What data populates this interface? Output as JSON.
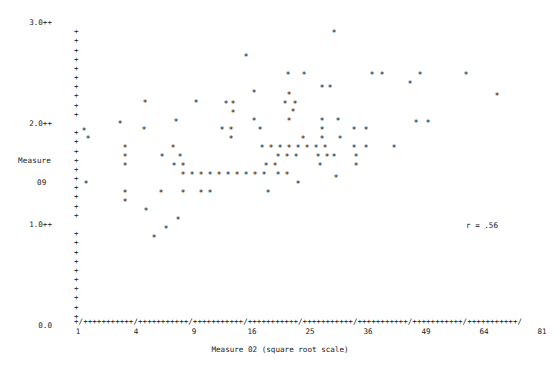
{
  "chart_data": {
    "type": "scatter",
    "title": "",
    "xlabel": "Measure 02 (square root scale)",
    "ylabel_line1": "Measure",
    "ylabel_line2": "09",
    "annotation": "r = .56",
    "correlation": 0.56,
    "x_scale": "square root",
    "x_tick_labels": [
      "1",
      "4",
      "9",
      "16",
      "25",
      "36",
      "49",
      "64",
      "81"
    ],
    "x_tick_values": [
      1,
      4,
      9,
      16,
      25,
      36,
      49,
      64,
      81
    ],
    "xlim": [
      1,
      81
    ],
    "y_tick_labels": [
      "3.0++",
      "2.0++",
      "1.0++",
      "0.0"
    ],
    "y_tick_values": [
      3.0,
      2.0,
      1.0,
      0.0
    ],
    "ylim": [
      0.0,
      3.0
    ],
    "grid": false,
    "legend": false,
    "axis_style": "character-plot",
    "axis_char_y": "+",
    "axis_char_x": "+",
    "axis_char_x_major": "/",
    "marker": "*",
    "x_axis_line": "+/+++++++++++/+++++++++++/+++++++++++/+++++++++++/+++++++++++/+++++++++++/+++++++++++/+++++++++++/",
    "y_axis_rows": [
      {
        "label": "3.0++",
        "tick": "",
        "value": 3.0
      },
      {
        "label": "",
        "tick": "+",
        "value": 2.91
      },
      {
        "label": "",
        "tick": "+",
        "value": 2.82
      },
      {
        "label": "",
        "tick": "+",
        "value": 2.73
      },
      {
        "label": "",
        "tick": "+",
        "value": 2.64
      },
      {
        "label": "",
        "tick": "+",
        "value": 2.55
      },
      {
        "label": "",
        "tick": "+",
        "value": 2.45
      },
      {
        "label": "",
        "tick": "+",
        "value": 2.36
      },
      {
        "label": "",
        "tick": "+",
        "value": 2.27
      },
      {
        "label": "",
        "tick": "+",
        "value": 2.18
      },
      {
        "label": "",
        "tick": "+",
        "value": 2.09
      },
      {
        "label": "2.0++",
        "tick": "",
        "value": 2.0
      },
      {
        "label": "",
        "tick": "+",
        "value": 1.91
      },
      {
        "label": "",
        "tick": "+",
        "value": 1.82
      },
      {
        "label": "",
        "tick": "+",
        "value": 1.73
      },
      {
        "label": "",
        "tick": "+",
        "value": 1.64
      },
      {
        "label": "",
        "tick": "+",
        "value": 1.55
      },
      {
        "label": "",
        "tick": "+",
        "value": 1.45
      },
      {
        "label": "",
        "tick": "+",
        "value": 1.36
      },
      {
        "label": "",
        "tick": "+",
        "value": 1.27
      },
      {
        "label": "",
        "tick": "+",
        "value": 1.18
      },
      {
        "label": "",
        "tick": "+",
        "value": 1.09
      },
      {
        "label": "1.0++",
        "tick": "",
        "value": 1.0
      },
      {
        "label": "",
        "tick": "+",
        "value": 0.91
      },
      {
        "label": "",
        "tick": "+",
        "value": 0.82
      },
      {
        "label": "",
        "tick": "+",
        "value": 0.73
      },
      {
        "label": "",
        "tick": "+",
        "value": 0.64
      },
      {
        "label": "",
        "tick": "+",
        "value": 0.55
      },
      {
        "label": "",
        "tick": "+",
        "value": 0.45
      },
      {
        "label": "",
        "tick": "+",
        "value": 0.36
      },
      {
        "label": "",
        "tick": "+",
        "value": 0.27
      },
      {
        "label": "",
        "tick": "+",
        "value": 0.18
      },
      {
        "label": "",
        "tick": "+",
        "value": 0.09
      },
      {
        "label": "0.0",
        "tick": "",
        "value": 0.0
      }
    ],
    "points": [
      {
        "px": 145,
        "py": 103,
        "x": 5.2,
        "y": 2.36
      },
      {
        "px": 246,
        "py": 57,
        "x": 21.0,
        "y": 2.82
      },
      {
        "px": 334,
        "py": 33,
        "x": 40.5,
        "y": 3.05
      },
      {
        "px": 288,
        "py": 75,
        "x": 30.0,
        "y": 2.64
      },
      {
        "px": 322,
        "py": 88,
        "x": 37.5,
        "y": 2.5
      },
      {
        "px": 304,
        "py": 75,
        "x": 33.5,
        "y": 2.64
      },
      {
        "px": 372,
        "py": 75,
        "x": 50.0,
        "y": 2.64
      },
      {
        "px": 382,
        "py": 75,
        "x": 53.0,
        "y": 2.64
      },
      {
        "px": 420,
        "py": 75,
        "x": 64.0,
        "y": 2.64
      },
      {
        "px": 466,
        "py": 75,
        "x": 78.0,
        "y": 2.64
      },
      {
        "px": 254,
        "py": 93,
        "x": 22.5,
        "y": 2.45
      },
      {
        "px": 289,
        "py": 95,
        "x": 30.2,
        "y": 2.43
      },
      {
        "px": 330,
        "py": 88,
        "x": 38.8,
        "y": 2.5
      },
      {
        "px": 410,
        "py": 84,
        "x": 61.0,
        "y": 2.54
      },
      {
        "px": 196,
        "py": 103,
        "x": 12.0,
        "y": 2.36
      },
      {
        "px": 226,
        "py": 104,
        "x": 17.5,
        "y": 2.35
      },
      {
        "px": 233,
        "py": 104,
        "x": 19.0,
        "y": 2.35
      },
      {
        "px": 285,
        "py": 104,
        "x": 29.2,
        "y": 2.35
      },
      {
        "px": 295,
        "py": 104,
        "x": 31.2,
        "y": 2.35
      },
      {
        "px": 497,
        "py": 96,
        "x": 86.0,
        "y": 2.42
      },
      {
        "px": 293,
        "py": 112,
        "x": 30.8,
        "y": 2.27
      },
      {
        "px": 233,
        "py": 113,
        "x": 19.0,
        "y": 2.26
      },
      {
        "px": 120,
        "py": 124,
        "x": 2.8,
        "y": 2.15
      },
      {
        "px": 176,
        "py": 122,
        "x": 9.0,
        "y": 2.17
      },
      {
        "px": 254,
        "py": 121,
        "x": 22.5,
        "y": 2.18
      },
      {
        "px": 289,
        "py": 121,
        "x": 30.2,
        "y": 2.18
      },
      {
        "px": 322,
        "py": 121,
        "x": 37.5,
        "y": 2.18
      },
      {
        "px": 338,
        "py": 121,
        "x": 41.0,
        "y": 2.18
      },
      {
        "px": 84,
        "py": 131,
        "x": 1.2,
        "y": 2.08
      },
      {
        "px": 144,
        "py": 130,
        "x": 5.1,
        "y": 2.09
      },
      {
        "px": 222,
        "py": 130,
        "x": 16.8,
        "y": 2.09
      },
      {
        "px": 231,
        "py": 130,
        "x": 18.6,
        "y": 2.09
      },
      {
        "px": 260,
        "py": 130,
        "x": 23.7,
        "y": 2.09
      },
      {
        "px": 322,
        "py": 130,
        "x": 37.5,
        "y": 2.09
      },
      {
        "px": 354,
        "py": 130,
        "x": 45.5,
        "y": 2.09
      },
      {
        "px": 416,
        "py": 123,
        "x": 63.0,
        "y": 2.16
      },
      {
        "px": 428,
        "py": 123,
        "x": 66.5,
        "y": 2.16
      },
      {
        "px": 231,
        "py": 139,
        "x": 18.6,
        "y": 2.0
      },
      {
        "px": 322,
        "py": 139,
        "x": 37.5,
        "y": 2.0
      },
      {
        "px": 366,
        "py": 130,
        "x": 48.5,
        "y": 2.09
      },
      {
        "px": 125,
        "py": 148,
        "x": 3.2,
        "y": 1.91
      },
      {
        "px": 173,
        "py": 148,
        "x": 8.7,
        "y": 1.91
      },
      {
        "px": 88,
        "py": 139,
        "x": 1.4,
        "y": 2.0
      },
      {
        "px": 262,
        "py": 148,
        "x": 24.0,
        "y": 1.91
      },
      {
        "px": 271,
        "py": 148,
        "x": 25.8,
        "y": 1.91
      },
      {
        "px": 280,
        "py": 148,
        "x": 27.6,
        "y": 1.91
      },
      {
        "px": 289,
        "py": 148,
        "x": 29.5,
        "y": 1.91
      },
      {
        "px": 298,
        "py": 148,
        "x": 31.5,
        "y": 1.91
      },
      {
        "px": 307,
        "py": 148,
        "x": 33.5,
        "y": 1.91
      },
      {
        "px": 316,
        "py": 148,
        "x": 35.5,
        "y": 1.91
      },
      {
        "px": 325,
        "py": 148,
        "x": 37.6,
        "y": 1.91
      },
      {
        "px": 354,
        "py": 148,
        "x": 45.5,
        "y": 1.91
      },
      {
        "px": 366,
        "py": 148,
        "x": 48.5,
        "y": 1.91
      },
      {
        "px": 394,
        "py": 148,
        "x": 56.5,
        "y": 1.91
      },
      {
        "px": 303,
        "py": 139,
        "x": 32.5,
        "y": 2.0
      },
      {
        "px": 340,
        "py": 139,
        "x": 41.5,
        "y": 2.0
      },
      {
        "px": 125,
        "py": 157,
        "x": 3.2,
        "y": 1.82
      },
      {
        "px": 162,
        "py": 157,
        "x": 7.5,
        "y": 1.82
      },
      {
        "px": 180,
        "py": 157,
        "x": 9.6,
        "y": 1.82
      },
      {
        "px": 278,
        "py": 157,
        "x": 27.2,
        "y": 1.82
      },
      {
        "px": 287,
        "py": 157,
        "x": 29.0,
        "y": 1.82
      },
      {
        "px": 296,
        "py": 157,
        "x": 31.0,
        "y": 1.82
      },
      {
        "px": 318,
        "py": 157,
        "x": 36.5,
        "y": 1.82
      },
      {
        "px": 327,
        "py": 157,
        "x": 38.5,
        "y": 1.82
      },
      {
        "px": 334,
        "py": 157,
        "x": 40.5,
        "y": 1.82
      },
      {
        "px": 356,
        "py": 157,
        "x": 46.0,
        "y": 1.82
      },
      {
        "px": 125,
        "py": 166,
        "x": 3.2,
        "y": 1.73
      },
      {
        "px": 174,
        "py": 166,
        "x": 8.8,
        "y": 1.73
      },
      {
        "px": 183,
        "py": 166,
        "x": 9.9,
        "y": 1.73
      },
      {
        "px": 266,
        "py": 166,
        "x": 24.8,
        "y": 1.73
      },
      {
        "px": 275,
        "py": 166,
        "x": 26.6,
        "y": 1.73
      },
      {
        "px": 320,
        "py": 166,
        "x": 37.0,
        "y": 1.73
      },
      {
        "px": 356,
        "py": 166,
        "x": 46.0,
        "y": 1.73
      },
      {
        "px": 183,
        "py": 175,
        "x": 9.9,
        "y": 1.64
      },
      {
        "px": 192,
        "py": 175,
        "x": 11.2,
        "y": 1.64
      },
      {
        "px": 201,
        "py": 175,
        "x": 12.5,
        "y": 1.64
      },
      {
        "px": 210,
        "py": 175,
        "x": 13.9,
        "y": 1.64
      },
      {
        "px": 219,
        "py": 175,
        "x": 15.4,
        "y": 1.64
      },
      {
        "px": 228,
        "py": 175,
        "x": 17.0,
        "y": 1.64
      },
      {
        "px": 237,
        "py": 175,
        "x": 19.6,
        "y": 1.64
      },
      {
        "px": 246,
        "py": 175,
        "x": 21.0,
        "y": 1.64
      },
      {
        "px": 255,
        "py": 175,
        "x": 22.8,
        "y": 1.64
      },
      {
        "px": 264,
        "py": 175,
        "x": 24.4,
        "y": 1.64
      },
      {
        "px": 278,
        "py": 175,
        "x": 27.2,
        "y": 1.64
      },
      {
        "px": 287,
        "py": 175,
        "x": 29.0,
        "y": 1.64
      },
      {
        "px": 86,
        "py": 184,
        "x": 1.3,
        "y": 1.55
      },
      {
        "px": 298,
        "py": 184,
        "x": 31.5,
        "y": 1.55
      },
      {
        "px": 336,
        "py": 178,
        "x": 41.0,
        "y": 1.61
      },
      {
        "px": 125,
        "py": 193,
        "x": 3.2,
        "y": 1.45
      },
      {
        "px": 161,
        "py": 193,
        "x": 7.4,
        "y": 1.45
      },
      {
        "px": 183,
        "py": 193,
        "x": 9.9,
        "y": 1.45
      },
      {
        "px": 201,
        "py": 193,
        "x": 12.5,
        "y": 1.45
      },
      {
        "px": 210,
        "py": 193,
        "x": 13.9,
        "y": 1.45
      },
      {
        "px": 268,
        "py": 193,
        "x": 25.2,
        "y": 1.45
      },
      {
        "px": 125,
        "py": 202,
        "x": 3.2,
        "y": 1.36
      },
      {
        "px": 146,
        "py": 211,
        "x": 5.3,
        "y": 1.27
      },
      {
        "px": 178,
        "py": 220,
        "x": 9.2,
        "y": 1.18
      },
      {
        "px": 166,
        "py": 229,
        "x": 8.0,
        "y": 1.09
      },
      {
        "px": 154,
        "py": 238,
        "x": 6.4,
        "y": 1.0
      }
    ]
  }
}
